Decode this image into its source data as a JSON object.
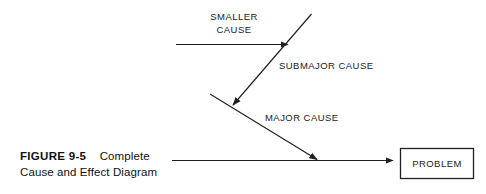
{
  "figure": {
    "number_label": "FIGURE 9-5",
    "title_line_1": "Complete",
    "title_line_2": "Cause and Effect Diagram"
  },
  "diagram": {
    "type": "cause-and-effect-fishbone",
    "effect_box_label": "PROBLEM",
    "labels": {
      "smaller_cause_line_1": "SMALLER",
      "smaller_cause_line_2": "CAUSE",
      "submajor_cause": "SUBMAJOR CAUSE",
      "major_cause": "MAJOR CAUSE"
    },
    "colors": {
      "ink": "#1a1a1a",
      "stroke": "#202020",
      "background": "#ffffff"
    }
  }
}
